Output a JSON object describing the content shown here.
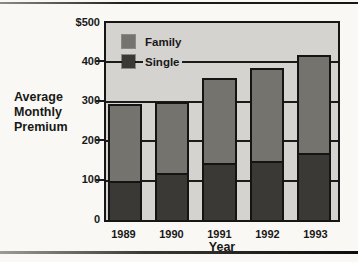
{
  "page": {
    "background": "#f9f8f5",
    "top_rule": true,
    "bottom_rule": true
  },
  "chart_data": {
    "type": "bar",
    "stacked": true,
    "title": "",
    "ylabel": "Average\nMonthly\nPremium",
    "xlabel": "Year",
    "categories": [
      "1989",
      "1990",
      "1991",
      "1992",
      "1993"
    ],
    "series": [
      {
        "name": "Single",
        "color": "#3a3936",
        "values": [
          100,
          120,
          145,
          150,
          170
        ]
      },
      {
        "name": "Family",
        "color": "#74736d",
        "values": [
          195,
          180,
          215,
          235,
          250
        ]
      }
    ],
    "totals": [
      295,
      300,
      360,
      385,
      420
    ],
    "ylim": [
      0,
      500
    ],
    "y_ticks": [
      {
        "value": 500,
        "label": "$500"
      },
      {
        "value": 400,
        "label": "400"
      },
      {
        "value": 300,
        "label": "300"
      },
      {
        "value": 200,
        "label": "200"
      },
      {
        "value": 100,
        "label": "100"
      },
      {
        "value": 0,
        "label": "0"
      }
    ],
    "gridlines": [
      100,
      200,
      300,
      400
    ],
    "legend": [
      {
        "label": "Family",
        "color": "#74736d"
      },
      {
        "label": "Single",
        "color": "#3a3936"
      }
    ],
    "legend_position": "top-left",
    "grid": true,
    "plot_background": "#d4d3d0",
    "axis_color": "#161616"
  }
}
